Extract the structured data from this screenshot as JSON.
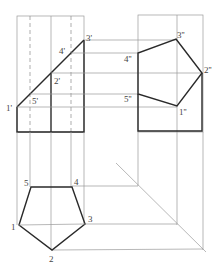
{
  "diagram": {
    "type": "orthographic-projection",
    "colors": {
      "thick": "#2a2a2a",
      "thin": "#9a9a9a",
      "dashed": "#8a8a8a",
      "label": "#444444"
    },
    "views": {
      "front": {
        "labels": [
          {
            "id": "1p",
            "text": "1'",
            "x": 6,
            "y": 111
          },
          {
            "id": "5p",
            "text": "5'",
            "x": 32,
            "y": 104
          },
          {
            "id": "2p",
            "text": "2'",
            "x": 54,
            "y": 84
          },
          {
            "id": "4p",
            "text": "4'",
            "x": 59,
            "y": 54
          },
          {
            "id": "3p",
            "text": "3'",
            "x": 86,
            "y": 41
          }
        ]
      },
      "side": {
        "labels": [
          {
            "id": "3pp",
            "text": "3''",
            "x": 177,
            "y": 38
          },
          {
            "id": "4pp",
            "text": "4''",
            "x": 124,
            "y": 62
          },
          {
            "id": "2pp",
            "text": "2''",
            "x": 204,
            "y": 73
          },
          {
            "id": "5pp",
            "text": "5''",
            "x": 124,
            "y": 102
          },
          {
            "id": "1pp",
            "text": "1''",
            "x": 179,
            "y": 115
          }
        ]
      },
      "top": {
        "labels": [
          {
            "id": "5",
            "text": "5",
            "x": 24,
            "y": 186
          },
          {
            "id": "4",
            "text": "4",
            "x": 74,
            "y": 185
          },
          {
            "id": "3",
            "text": "3",
            "x": 88,
            "y": 222
          },
          {
            "id": "2",
            "text": "2",
            "x": 49,
            "y": 262
          },
          {
            "id": "1",
            "text": "1",
            "x": 11,
            "y": 230
          }
        ]
      }
    }
  }
}
